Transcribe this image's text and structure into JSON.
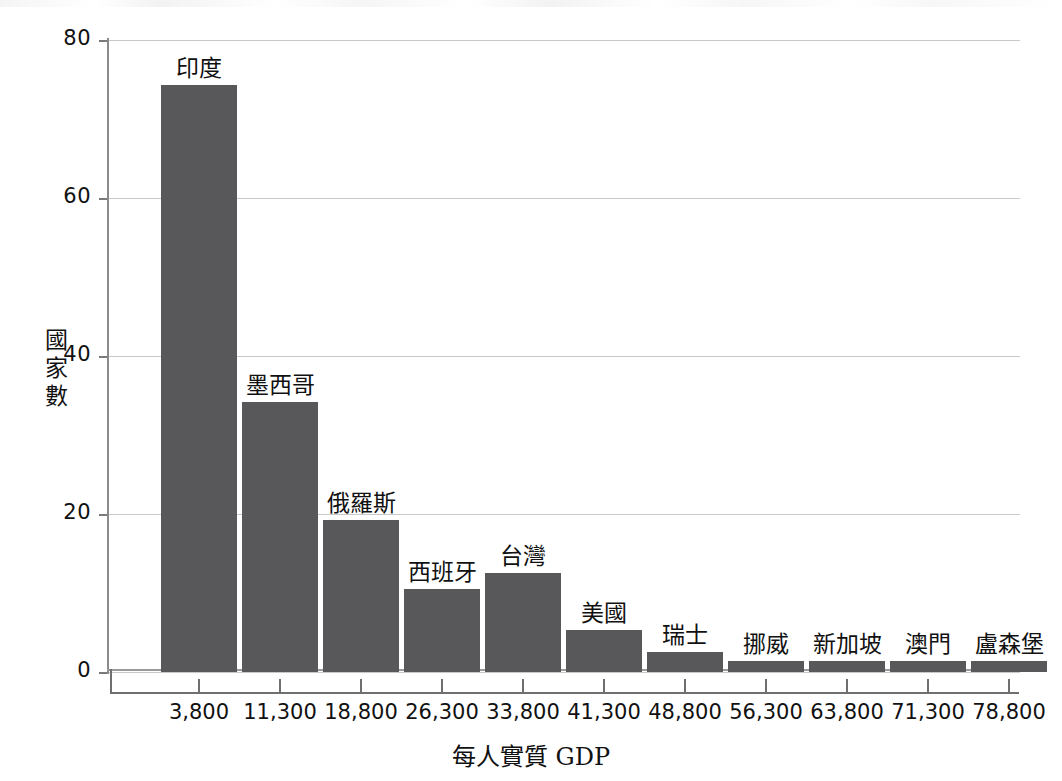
{
  "chart_data": {
    "type": "bar",
    "title": "",
    "xlabel": "每人實質 GDP",
    "ylabel": "國家數",
    "ylabel_chars": [
      "國",
      "家",
      "數"
    ],
    "categories": [
      "3,800",
      "11,300",
      "18,800",
      "26,300",
      "33,800",
      "41,300",
      "48,800",
      "56,300",
      "63,800",
      "71,300",
      "78,800"
    ],
    "values": [
      74.3,
      34.2,
      19.2,
      10.5,
      12.5,
      5.3,
      2.5,
      1.4,
      1.4,
      1.4,
      1.4
    ],
    "point_labels": [
      "印度",
      "墨西哥",
      "俄羅斯",
      "西班牙",
      "台灣",
      "美國",
      "瑞士",
      "挪威",
      "新加坡",
      "澳門",
      "盧森堡"
    ],
    "yticks": [
      0,
      20,
      40,
      60,
      80
    ],
    "ylim": [
      0,
      80
    ],
    "grid": true,
    "legend": false,
    "bar_color": "#58585a",
    "grid_color": "#c9c9c9",
    "axis_color": "#6f6f6f",
    "background": "#ffffff"
  }
}
